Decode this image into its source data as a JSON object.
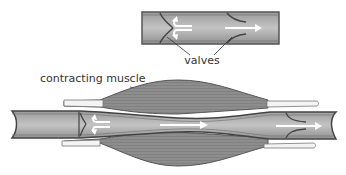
{
  "diagram": {
    "type": "vein-valve-muscle-pump",
    "labels": {
      "valves": "valves",
      "muscle": "contracting muscle"
    },
    "colors": {
      "vein_fill": "#a9a9a9",
      "vein_wall": "#555555",
      "muscle_fill": "#8c8c8c",
      "muscle_stripe": "#7a7a7a",
      "tendon": "#f2f2f2",
      "arrow": "#ffffff",
      "text": "#333333"
    },
    "panels": [
      {
        "id": "resting-vein",
        "description": "Vein segment with two valves; open valve lets blood flow right, closed valve blocks backflow"
      },
      {
        "id": "squeezed-vein",
        "description": "Vein squeezed between contracting muscles; blood pushed forward through open valve"
      }
    ]
  }
}
